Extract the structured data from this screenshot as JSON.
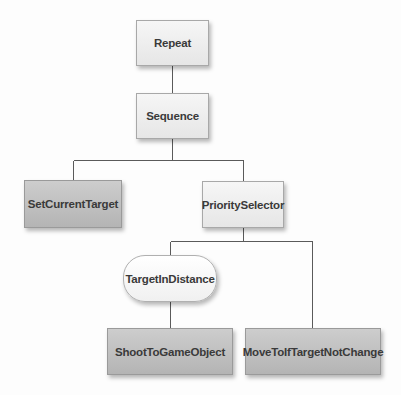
{
  "diagram": {
    "type": "behavior-tree",
    "nodes": [
      {
        "id": "repeat",
        "label": "Repeat",
        "kind": "composite"
      },
      {
        "id": "sequence",
        "label": "Sequence",
        "kind": "composite"
      },
      {
        "id": "set_current_target",
        "label": "SetCurrentTarget",
        "kind": "action"
      },
      {
        "id": "priority_selector",
        "label": "PrioritySelector",
        "kind": "composite"
      },
      {
        "id": "target_in_distance",
        "label": "TargetInDistance",
        "kind": "condition"
      },
      {
        "id": "shoot_to_game_object",
        "label": "ShootToGameObject",
        "kind": "action"
      },
      {
        "id": "move_to_if_target_not_change",
        "label": "MoveToIfTargetNotChange",
        "kind": "action"
      }
    ],
    "edges": [
      {
        "from": "repeat",
        "to": "sequence"
      },
      {
        "from": "sequence",
        "to": "set_current_target"
      },
      {
        "from": "sequence",
        "to": "priority_selector"
      },
      {
        "from": "priority_selector",
        "to": "target_in_distance"
      },
      {
        "from": "priority_selector",
        "to": "move_to_if_target_not_change"
      },
      {
        "from": "target_in_distance",
        "to": "shoot_to_game_object"
      }
    ],
    "colors": {
      "composite_fill": "#eeeeee",
      "action_fill": "#c0c0c0",
      "condition_fill": "#f8f8f8",
      "edge": "#555555",
      "text": "#3a3a3a"
    }
  }
}
